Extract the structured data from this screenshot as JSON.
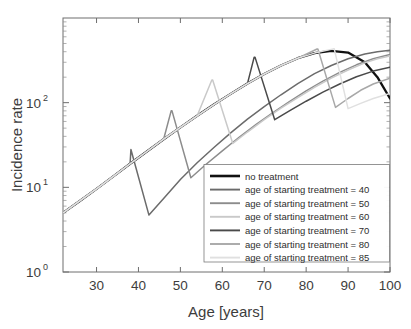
{
  "chart_data": {
    "type": "line",
    "title": "",
    "xlabel": "Age [years]",
    "ylabel": "Incidence rate",
    "xlim": [
      22,
      100
    ],
    "ylim": [
      1,
      1000
    ],
    "yscale": "log",
    "xticks": [
      30,
      40,
      50,
      60,
      70,
      80,
      90,
      100
    ],
    "xticklabels": [
      "30",
      "40",
      "50",
      "60",
      "70",
      "80",
      "90",
      "100"
    ],
    "yticks": [
      1,
      10,
      100
    ],
    "yticklabels": [
      "10^0",
      "10^1",
      "10^2"
    ],
    "ytick_mantissa": "10",
    "ytick_exponents": [
      "0",
      "1",
      "2"
    ],
    "grid": false,
    "legend_position": "lower right",
    "series": [
      {
        "name": "no treatment",
        "color": "#111111",
        "width": 2.3,
        "treatment_age": null,
        "x": [
          22,
          26,
          30,
          34,
          38,
          42,
          46,
          50,
          54,
          58,
          62,
          66,
          70,
          74,
          78,
          82,
          86,
          90,
          94,
          97,
          100
        ],
        "y": [
          5.0,
          6.9,
          9.6,
          13.5,
          19.0,
          26.5,
          37.0,
          51.0,
          70.0,
          95.0,
          127.0,
          168.0,
          218.0,
          275.0,
          335.0,
          385.0,
          410.0,
          390.0,
          300.0,
          200.0,
          112.0
        ]
      },
      {
        "name": "age of starting treatment = 40",
        "color": "#6b6b6b",
        "width": 1.5,
        "treatment_age": 40,
        "x": [
          22,
          26,
          30,
          34,
          38,
          38.2,
          42.5,
          46,
          50,
          54,
          58,
          62,
          66,
          70,
          74,
          78,
          82,
          86,
          90,
          94,
          97,
          100
        ],
        "y": [
          5.0,
          6.9,
          9.6,
          13.5,
          19.0,
          28.0,
          4.7,
          7.4,
          12.4,
          19.5,
          29.5,
          44.0,
          64.0,
          90.0,
          124.0,
          168.0,
          220.0,
          275.0,
          330.0,
          375.0,
          400.0,
          415.0
        ]
      },
      {
        "name": "age of starting treatment = 50",
        "color": "#8c8c8c",
        "width": 1.5,
        "treatment_age": 50,
        "x": [
          22,
          26,
          30,
          34,
          38,
          42,
          46,
          47.8,
          48,
          52.5,
          56,
          60,
          64,
          68,
          72,
          76,
          80,
          84,
          88,
          92,
          96,
          100
        ],
        "y": [
          5.0,
          6.9,
          9.6,
          13.5,
          19.0,
          26.5,
          37.0,
          80.0,
          80.0,
          13.0,
          18.5,
          27.0,
          39.0,
          55.0,
          76.0,
          103.0,
          138.0,
          180.0,
          228.0,
          280.0,
          330.0,
          370.0
        ]
      },
      {
        "name": "age of starting treatment = 60",
        "color": "#c9c9c9",
        "width": 1.5,
        "treatment_age": 60,
        "x": [
          22,
          26,
          30,
          34,
          38,
          42,
          46,
          50,
          54,
          57.5,
          57.7,
          62.5,
          66,
          70,
          74,
          78,
          82,
          86,
          90,
          94,
          97,
          100
        ],
        "y": [
          5.0,
          6.9,
          9.6,
          13.5,
          19.0,
          26.5,
          37.0,
          51.0,
          70.0,
          185.0,
          185.0,
          33.0,
          45.0,
          63.0,
          86.0,
          115.0,
          152.0,
          195.0,
          243.0,
          295.0,
          330.0,
          355.0
        ]
      },
      {
        "name": "age of starting treatment = 70",
        "color": "#4a4a4a",
        "width": 1.5,
        "treatment_age": 70,
        "x": [
          22,
          26,
          30,
          34,
          38,
          42,
          46,
          50,
          54,
          58,
          62,
          66,
          67.6,
          67.8,
          72.5,
          76,
          80,
          84,
          88,
          92,
          96,
          100
        ],
        "y": [
          5.0,
          6.9,
          9.6,
          13.5,
          19.0,
          26.5,
          37.0,
          51.0,
          70.0,
          95.0,
          127.0,
          168.0,
          345.0,
          345.0,
          63.0,
          80.0,
          104.0,
          133.0,
          166.0,
          202.0,
          236.0,
          262.0
        ]
      },
      {
        "name": "age of starting treatment = 80",
        "color": "#a8a8a8",
        "width": 1.5,
        "treatment_age": 80,
        "x": [
          22,
          26,
          30,
          34,
          38,
          42,
          46,
          50,
          54,
          58,
          62,
          66,
          70,
          74,
          78,
          82.6,
          82.8,
          87,
          90,
          93,
          96,
          100
        ],
        "y": [
          5.0,
          6.9,
          9.6,
          13.5,
          19.0,
          26.5,
          37.0,
          51.0,
          70.0,
          95.0,
          127.0,
          168.0,
          218.0,
          275.0,
          335.0,
          430.0,
          430.0,
          88.0,
          112.0,
          140.0,
          166.0,
          195.0
        ]
      },
      {
        "name": "age of starting treatment = 85",
        "color": "#e0e0e0",
        "width": 1.5,
        "treatment_age": 85,
        "x": [
          22,
          26,
          30,
          34,
          38,
          42,
          46,
          50,
          54,
          58,
          62,
          66,
          70,
          74,
          78,
          82,
          86.5,
          86.7,
          90,
          93,
          96,
          100
        ],
        "y": [
          5.0,
          6.9,
          9.6,
          13.5,
          19.0,
          26.5,
          37.0,
          51.0,
          70.0,
          95.0,
          127.0,
          168.0,
          218.0,
          275.0,
          335.0,
          385.0,
          432.0,
          432.0,
          85.0,
          98.0,
          112.0,
          128.0
        ]
      }
    ]
  },
  "legend": {
    "entries": [
      "no treatment",
      "age of starting treatment = 40",
      "age of starting treatment = 50",
      "age of starting treatment = 60",
      "age of starting treatment = 70",
      "age of starting treatment = 80",
      "age of starting treatment = 85"
    ]
  }
}
